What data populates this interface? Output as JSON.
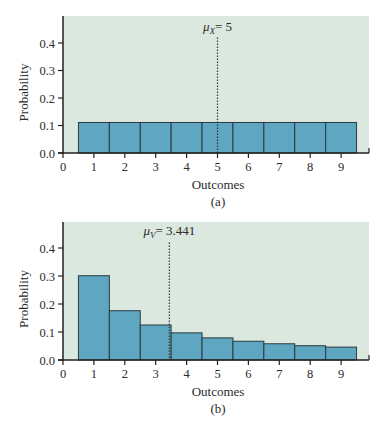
{
  "colors": {
    "plot_bg": "#dbe8df",
    "bar_fill": "#5fa6c1",
    "bar_stroke": "#2a3a42",
    "axis": "#222222",
    "text": "#2b2b2b"
  },
  "chart_data": [
    {
      "type": "bar",
      "panel_label": "(a)",
      "xlabel": "Outcomes",
      "ylabel": "Probability",
      "categories": [
        1,
        2,
        3,
        4,
        5,
        6,
        7,
        8,
        9
      ],
      "values": [
        0.111,
        0.111,
        0.111,
        0.111,
        0.111,
        0.111,
        0.111,
        0.111,
        0.111
      ],
      "x_ticks": [
        "0",
        "1",
        "2",
        "3",
        "4",
        "5",
        "6",
        "7",
        "8",
        "9"
      ],
      "y_ticks": [
        "0.0",
        "0.1",
        "0.2",
        "0.3",
        "0.4"
      ],
      "xlim": [
        0,
        9.9
      ],
      "ylim": [
        0,
        0.47
      ],
      "grid": false,
      "mean_line": {
        "x": 5,
        "label_symbol": "μ",
        "label_subscript": "X",
        "label_value": "= 5"
      },
      "layout": {
        "left": 63,
        "right": 369,
        "top": 16,
        "bottom": 153,
        "unit_x": 30.9,
        "unit_y": 275
      }
    },
    {
      "type": "bar",
      "panel_label": "(b)",
      "xlabel": "Outcomes",
      "ylabel": "Probability",
      "categories": [
        1,
        2,
        3,
        4,
        5,
        6,
        7,
        8,
        9
      ],
      "values": [
        0.301,
        0.176,
        0.125,
        0.097,
        0.079,
        0.067,
        0.058,
        0.051,
        0.046
      ],
      "x_ticks": [
        "0",
        "1",
        "2",
        "3",
        "4",
        "5",
        "6",
        "7",
        "8",
        "9"
      ],
      "y_ticks": [
        "0.0",
        "0.1",
        "0.2",
        "0.3",
        "0.4"
      ],
      "xlim": [
        0,
        9.9
      ],
      "ylim": [
        0,
        0.49
      ],
      "grid": false,
      "mean_line": {
        "x": 3.441,
        "label_symbol": "μ",
        "label_subscript": "V",
        "label_value": "= 3.441"
      },
      "layout": {
        "left": 63,
        "right": 369,
        "top": 222,
        "bottom": 360,
        "unit_x": 30.9,
        "unit_y": 280
      }
    }
  ]
}
